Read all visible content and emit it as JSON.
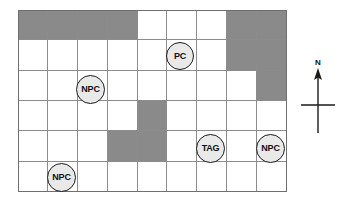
{
  "figure": {
    "type": "tactical-grid-map",
    "grid": {
      "columns": 9,
      "rows": 6,
      "shaded_color": "#8a8a8a",
      "empty_color": "#ffffff",
      "line_color": "#8c8c8c",
      "border_color": "#6f6f6f",
      "shaded_cells": [
        {
          "row": 1,
          "col": 1
        },
        {
          "row": 1,
          "col": 2
        },
        {
          "row": 1,
          "col": 3
        },
        {
          "row": 1,
          "col": 4
        },
        {
          "row": 1,
          "col": 8
        },
        {
          "row": 1,
          "col": 9
        },
        {
          "row": 2,
          "col": 8
        },
        {
          "row": 2,
          "col": 9
        },
        {
          "row": 3,
          "col": 9
        },
        {
          "row": 4,
          "col": 5
        },
        {
          "row": 5,
          "col": 4
        },
        {
          "row": 5,
          "col": 5
        }
      ]
    },
    "tokens": [
      {
        "id": "token-pc",
        "label": "PC",
        "left": 166,
        "top": 42,
        "size": 28,
        "font_size": 9
      },
      {
        "id": "token-npc-left",
        "label": "NPC",
        "left": 76,
        "top": 75,
        "size": 29,
        "font_size": 9
      },
      {
        "id": "token-tag",
        "label": "TAG",
        "left": 196,
        "top": 134,
        "size": 29,
        "font_size": 9
      },
      {
        "id": "token-npc-right",
        "label": "NPC",
        "left": 256,
        "top": 134,
        "size": 29,
        "font_size": 9
      },
      {
        "id": "token-npc-bottom",
        "label": "NPC",
        "left": 47,
        "top": 163,
        "size": 29,
        "font_size": 9
      }
    ],
    "compass": {
      "label": "N",
      "direction": "north",
      "line_color": "#1a1a1a"
    }
  }
}
